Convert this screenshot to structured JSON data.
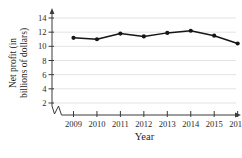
{
  "chart": {
    "ylabel": "Net profit (in\nbillions of dollars)",
    "xlabel": "Year"
  },
  "chart_data": {
    "type": "line",
    "title": "",
    "xlabel": "Year",
    "ylabel": "Net profit (in billions of dollars)",
    "x": [
      2009,
      2010,
      2011,
      2012,
      2013,
      2014,
      2015,
      2016
    ],
    "series": [
      {
        "name": "Net profit",
        "values": [
          11.2,
          11.0,
          11.8,
          11.4,
          11.9,
          12.2,
          11.5,
          10.4
        ]
      }
    ],
    "yticks": [
      2,
      4,
      6,
      8,
      10,
      12,
      14
    ],
    "ylim": [
      2,
      14.8
    ],
    "axis_break": true,
    "grid": true,
    "legend": false,
    "line_color": "#161616",
    "marker_color": "#161616",
    "axis_color": "#3a3a3a",
    "text_color": "#2a2a2a",
    "grid_color": "#dcdcdc",
    "background": "#ffffff"
  }
}
